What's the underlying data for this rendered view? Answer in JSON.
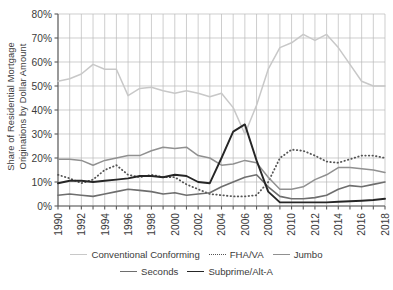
{
  "chart_data": {
    "type": "line",
    "title": "",
    "xlabel": "",
    "ylabel": "Share of Residential Mortgage Originations by Dollar Amount",
    "x": [
      1990,
      1991,
      1992,
      1993,
      1994,
      1995,
      1996,
      1997,
      1998,
      1999,
      2000,
      2001,
      2002,
      2003,
      2004,
      2005,
      2006,
      2007,
      2008,
      2009,
      2010,
      2011,
      2012,
      2013,
      2014,
      2015,
      2016,
      2017,
      2018
    ],
    "xlim": [
      1990,
      2018
    ],
    "ylim": [
      0,
      80
    ],
    "ytick_values": [
      0,
      10,
      20,
      30,
      40,
      50,
      60,
      70,
      80
    ],
    "ytick_labels": [
      "0%",
      "10%",
      "20%",
      "30%",
      "40%",
      "50%",
      "60%",
      "70%",
      "80%"
    ],
    "xtick_labels": [
      "1990",
      "1992",
      "1994",
      "1996",
      "1998",
      "2000",
      "2002",
      "2004",
      "2006",
      "2008",
      "2010",
      "2012",
      "2014",
      "2016",
      "2018"
    ],
    "grid": true,
    "legend_position": "bottom",
    "series": [
      {
        "name": "Conventional Conforming",
        "color": "#c8c8c8",
        "style": "solid",
        "width": 1.5,
        "values": [
          52,
          53,
          55,
          59,
          57,
          57,
          46,
          49,
          49.5,
          48,
          47,
          48,
          47,
          45.5,
          47,
          41,
          30,
          42,
          57,
          66,
          68,
          71.5,
          69,
          71.5,
          66,
          59,
          52,
          50,
          50
        ]
      },
      {
        "name": "FHA/VA",
        "color": "#555555",
        "style": "dotted",
        "width": 1.8,
        "values": [
          13,
          11.5,
          9.5,
          11,
          15,
          17,
          13,
          12,
          13,
          12,
          12,
          9,
          7,
          5,
          4.5,
          4,
          4,
          4.5,
          10,
          20,
          23.5,
          23,
          21,
          18.5,
          18,
          19.5,
          21,
          21,
          20
        ]
      },
      {
        "name": "Jumbo",
        "color": "#909090",
        "style": "solid",
        "width": 1.5,
        "values": [
          19.5,
          19.5,
          19,
          17,
          19,
          20,
          21,
          21,
          23,
          24.5,
          24,
          24.5,
          21,
          20,
          17,
          17.5,
          19,
          18,
          12,
          7,
          7,
          8,
          11,
          13,
          16,
          16,
          15.5,
          15,
          14
        ]
      },
      {
        "name": "Seconds",
        "color": "#6e6e6e",
        "style": "solid",
        "width": 1.6,
        "values": [
          4.5,
          5,
          4.5,
          4,
          5,
          6,
          7,
          6.5,
          6,
          5,
          5.5,
          4.5,
          5,
          5.5,
          8,
          10,
          12,
          13,
          8,
          4,
          3,
          3,
          3.5,
          4.5,
          7,
          8.5,
          8,
          9,
          10
        ]
      },
      {
        "name": "Subprime/Alt-A",
        "color": "#262626",
        "style": "solid",
        "width": 1.9,
        "values": [
          9.5,
          10.5,
          10.5,
          10,
          10.5,
          11,
          11.5,
          12.5,
          12.5,
          12,
          13,
          12.5,
          10,
          9.5,
          20,
          31,
          34,
          19,
          6,
          1.5,
          1.5,
          1.5,
          1.5,
          1.5,
          1.8,
          2,
          2.2,
          2.5,
          3
        ]
      }
    ]
  },
  "legend": {
    "rows": [
      [
        "Conventional Conforming",
        "FHA/VA",
        "Jumbo"
      ],
      [
        "Seconds",
        "Subprime/Alt-A"
      ]
    ]
  },
  "axis": {
    "ylabel": "Share of Residential Mortgage Originations by Dollar Amount"
  }
}
